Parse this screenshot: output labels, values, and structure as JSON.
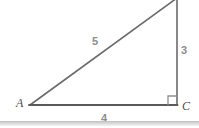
{
  "figure": {
    "type": "right-triangle-diagram",
    "background_color": "#ffffff",
    "line_color": "#5a5a5a",
    "side_label_color": "#8c8c8c",
    "vertex_label_color": "#4d4d4d",
    "divider_color": "#cccccc",
    "vertices": {
      "a": {
        "label": "A",
        "x": 30,
        "y": 105
      },
      "c": {
        "label": "C",
        "x": 177,
        "y": 105
      },
      "apex": {
        "label": "",
        "x": 177,
        "y": 0
      }
    },
    "sides": {
      "hypotenuse": {
        "label": "5",
        "from": "A",
        "to": "apex"
      },
      "vertical": {
        "label": "3",
        "from": "apex",
        "to": "C"
      },
      "horizontal": {
        "label": "4",
        "from": "A",
        "to": "C"
      }
    },
    "right_angle": {
      "at": "C",
      "marker": "square"
    }
  }
}
